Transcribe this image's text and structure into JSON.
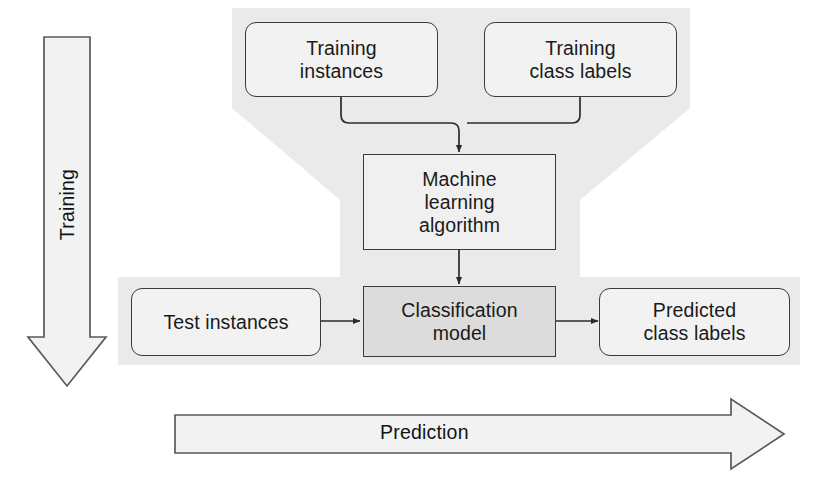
{
  "diagram": {
    "colors": {
      "backdrop_gray": "#eaeaea",
      "node_fill": "#f2f2f2",
      "model_fill": "#dcdcdc",
      "stroke": "#3b3b3b",
      "text": "#1a1a1a",
      "page_background": "#ffffff"
    },
    "nodes": [
      {
        "id": "training-instances",
        "label": "Training\ninstances",
        "shape": "rounded-rect",
        "phase": "training"
      },
      {
        "id": "training-class-labels",
        "label": "Training\nclass labels",
        "shape": "rounded-rect",
        "phase": "training"
      },
      {
        "id": "machine-learning-algorithm",
        "label": "Machine\nlearning\nalgorithm",
        "shape": "rect",
        "phase": "training"
      },
      {
        "id": "classification-model",
        "label": "Classification\nmodel",
        "shape": "rect",
        "phase": "both"
      },
      {
        "id": "test-instances",
        "label": "Test instances",
        "shape": "rounded-rect",
        "phase": "prediction"
      },
      {
        "id": "predicted-class-labels",
        "label": "Predicted\nclass labels",
        "shape": "rounded-rect",
        "phase": "prediction"
      }
    ],
    "flow_arrows": [
      {
        "id": "training-flow",
        "label": "Training",
        "direction": "down",
        "orientation": "vertical"
      },
      {
        "id": "prediction-flow",
        "label": "Prediction",
        "direction": "right",
        "orientation": "horizontal"
      }
    ],
    "connections": [
      {
        "from": "training-instances",
        "to": "machine-learning-algorithm",
        "style": "elbow-merge"
      },
      {
        "from": "training-class-labels",
        "to": "machine-learning-algorithm",
        "style": "elbow-merge"
      },
      {
        "from": "machine-learning-algorithm",
        "to": "classification-model",
        "style": "straight-down"
      },
      {
        "from": "test-instances",
        "to": "classification-model",
        "style": "straight-right"
      },
      {
        "from": "classification-model",
        "to": "predicted-class-labels",
        "style": "straight-right"
      }
    ]
  }
}
